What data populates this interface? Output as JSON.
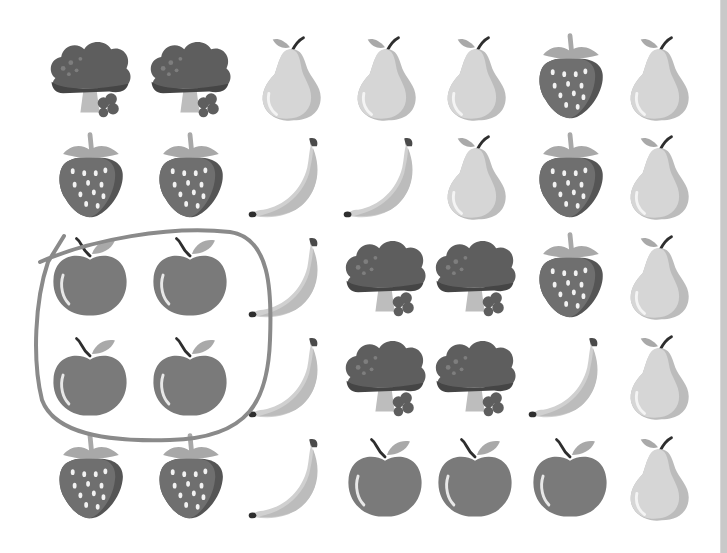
{
  "worksheet": {
    "grid_rows": 5,
    "grid_cols": 7,
    "column_centers_x": [
      90,
      190,
      290,
      385,
      475,
      570,
      658
    ],
    "row_centers_y": [
      78,
      177,
      277,
      377,
      478
    ],
    "items": [
      [
        "broccoli",
        "broccoli",
        "pear",
        "pear",
        "pear",
        "strawberry",
        "pear"
      ],
      [
        "strawberry",
        "strawberry",
        "banana",
        "banana",
        "pear",
        "strawberry",
        "pear"
      ],
      [
        "apple",
        "apple",
        "banana",
        "broccoli",
        "broccoli",
        "strawberry",
        "pear"
      ],
      [
        "apple",
        "apple",
        "banana",
        "broccoli",
        "broccoli",
        "banana",
        "pear"
      ],
      [
        "strawberry",
        "strawberry",
        "banana",
        "apple",
        "apple",
        "apple",
        "pear"
      ]
    ],
    "circled_group": {
      "item": "apple",
      "count": 4,
      "cells": [
        [
          2,
          0
        ],
        [
          2,
          1
        ],
        [
          3,
          0
        ],
        [
          3,
          1
        ]
      ]
    }
  },
  "colors": {
    "background": "#ffffff",
    "apple": "#7a7a7a",
    "broccoli": "#5e5e5e",
    "broccoli_stem": "#bdbdbd",
    "strawberry": "#6f6f6f",
    "strawberry_leaf": "#a8a8a8",
    "pear": "#d6d6d6",
    "pear_shade": "#bcbcbc",
    "banana": "#d0d0d0",
    "circle_stroke": "#8a8a8a",
    "side_bar": "#c9c9c9"
  },
  "icons": {
    "apple": "apple-icon",
    "pear": "pear-icon",
    "banana": "banana-icon",
    "strawberry": "strawberry-icon",
    "broccoli": "broccoli-icon"
  }
}
